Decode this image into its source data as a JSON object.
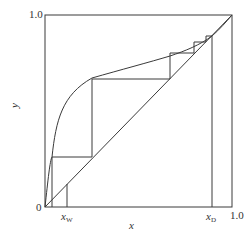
{
  "diagram": {
    "type": "McCabe-Thiele distillation diagram",
    "colors": {
      "line": "#3a3a3a",
      "background": "#ffffff",
      "text": "#333333"
    },
    "axes": {
      "x_label": "x",
      "y_label": "y",
      "origin_label": "0",
      "y_max_label": "1.0",
      "x_max_label": "1.0"
    },
    "markers": {
      "x_w": {
        "symbol": "x",
        "subscript": "W"
      },
      "x_d": {
        "symbol": "x",
        "subscript": "D"
      }
    },
    "elements": [
      "equilibrium-curve",
      "diagonal-line",
      "stage-steps",
      "x_w-vertical",
      "x_d-vertical"
    ]
  }
}
